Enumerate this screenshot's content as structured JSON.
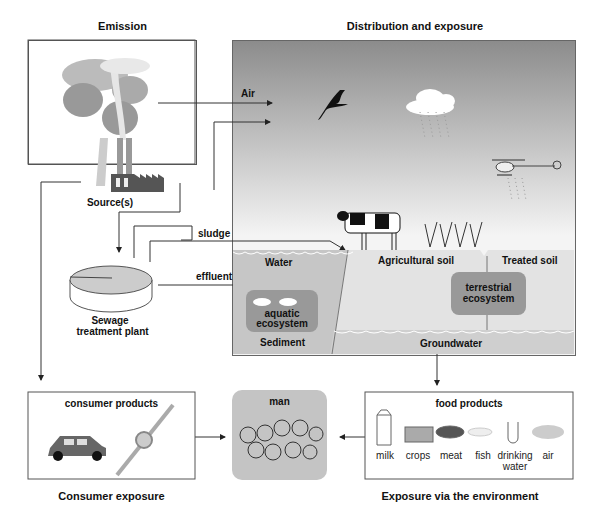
{
  "sections": {
    "emission": "Emission",
    "distribution": "Distribution and exposure",
    "consumer_exposure": "Consumer exposure",
    "environment_exposure": "Exposure via the environment"
  },
  "emission": {
    "source": "Source(s)",
    "sewage_line1": "Sewage",
    "sewage_line2": "treatment plant"
  },
  "flows": {
    "air": "Air",
    "sludge": "sludge",
    "effluent": "effluent"
  },
  "compartments": {
    "water": "Water",
    "sediment": "Sediment",
    "agricultural_soil": "Agricultural soil",
    "treated_soil": "Treated soil",
    "groundwater": "Groundwater",
    "aquatic_line1": "aquatic",
    "aquatic_line2": "ecosystem",
    "terrestrial_line1": "terrestrial",
    "terrestrial_line2": "ecosystem"
  },
  "consumer": {
    "title": "consumer products"
  },
  "man": {
    "title": "man"
  },
  "food": {
    "title": "food products",
    "items": [
      {
        "label": "milk"
      },
      {
        "label": "crops"
      },
      {
        "label": "meat"
      },
      {
        "label": "fish"
      },
      {
        "label": "drinking",
        "label2": "water"
      },
      {
        "label": "air"
      }
    ]
  },
  "colors": {
    "sky_top": "#8c8c8c",
    "sky_bottom": "#f2f2f2",
    "water": "#c8c8c8",
    "soil": "#e0e0e0",
    "ecosystem": "#9a9a9a",
    "man_bg": "#c4c4c4"
  }
}
